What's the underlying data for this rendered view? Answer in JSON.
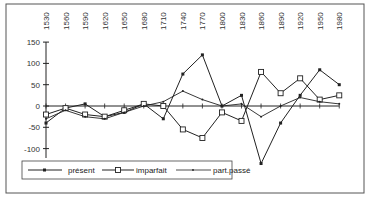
{
  "chart_data": {
    "type": "line",
    "title": "",
    "xlabel": "",
    "ylabel": "",
    "x": [
      1530,
      1560,
      1590,
      1620,
      1650,
      1680,
      1710,
      1740,
      1770,
      1800,
      1830,
      1860,
      1890,
      1920,
      1950,
      1980
    ],
    "x_tick_labels": [
      "1530",
      "1560",
      "1590",
      "1620",
      "1650",
      "1680",
      "1710",
      "1740",
      "1770",
      "1800",
      "1830",
      "1860",
      "1890",
      "1920",
      "1950",
      "1980"
    ],
    "y_tick_labels": [
      "150",
      "100",
      "50",
      "0",
      "-50",
      "-100"
    ],
    "y_ticks": [
      150,
      100,
      50,
      0,
      -50,
      -100
    ],
    "ylim": [
      -150,
      150
    ],
    "grid": false,
    "legend_position": "bottom-left inside",
    "series": [
      {
        "name": "présent",
        "marker": "filled-square-small",
        "values": [
          -40,
          -5,
          5,
          -25,
          -15,
          5,
          -30,
          75,
          120,
          0,
          25,
          -135,
          -40,
          25,
          85,
          50
        ]
      },
      {
        "name": "imparfait",
        "marker": "open-square",
        "values": [
          -20,
          -5,
          -20,
          -25,
          -10,
          5,
          0,
          -55,
          -75,
          -15,
          -35,
          80,
          30,
          65,
          15,
          25
        ]
      },
      {
        "name": "part.passé",
        "marker": "small-dot",
        "values": [
          -30,
          -10,
          -25,
          -30,
          -15,
          0,
          10,
          35,
          15,
          0,
          5,
          -25,
          0,
          20,
          10,
          5
        ]
      }
    ]
  },
  "legend": {
    "items": [
      {
        "label": "présent"
      },
      {
        "label": "imparfait"
      },
      {
        "label": "part.passé"
      }
    ]
  },
  "colors": {
    "line": "#222222",
    "frame": "#555555",
    "background": "#ffffff"
  }
}
